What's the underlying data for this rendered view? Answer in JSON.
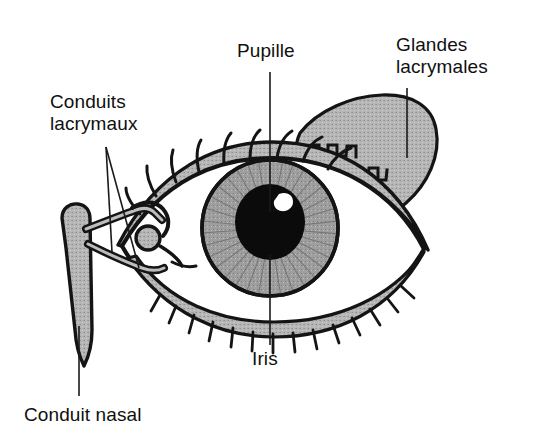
{
  "figure": {
    "language": "fr",
    "background_color": "#ffffff",
    "ink_color": "#101010",
    "tissue_fill_color": "#b4b4b4",
    "iris_fill_color": "#9a9a9a",
    "pupil_fill_color": "#0a0a0a",
    "highlight_color": "#ffffff",
    "sclera_fill_color": "#ffffff"
  },
  "labels": {
    "pupille": "Pupille",
    "glandes_line1": "Glandes",
    "glandes_line2": "lacrymales",
    "conduits_line1": "Conduits",
    "conduits_line2": "lacrymaux",
    "iris": "Iris",
    "conduit_nasal": "Conduit nasal"
  },
  "parts": [
    {
      "id": "pupille",
      "label": "Pupille",
      "description": "Pupille noire centrale avec reflet blanc",
      "color": "#0a0a0a",
      "leader": {
        "x1": 270,
        "y1": 72,
        "x2": 270,
        "y2": 212
      }
    },
    {
      "id": "glandes-lacrymales",
      "label": "Glandes lacrymales",
      "description": "Glande lacrymale lobée grise au-dessus de la paupière supérieure externe",
      "color": "#b4b4b4",
      "leader": {
        "x1": 407,
        "y1": 88,
        "x2": 407,
        "y2": 158
      }
    },
    {
      "id": "conduits-lacrymaux",
      "label": "Conduits lacrymaux",
      "description": "Canalicules lacrymaux au coin interne de l'œil",
      "color": "#b4b4b4",
      "leaders": [
        {
          "x1": 106,
          "y1": 147,
          "x2": 112,
          "y2": 252
        },
        {
          "x1": 106,
          "y1": 147,
          "x2": 139,
          "y2": 268
        }
      ]
    },
    {
      "id": "iris",
      "label": "Iris",
      "description": "Iris gris strié radialement entourant la pupille",
      "color": "#9a9a9a",
      "leader": {
        "x1": 270,
        "y1": 255,
        "x2": 270,
        "y2": 345
      }
    },
    {
      "id": "conduit-nasal",
      "label": "Conduit nasal",
      "description": "Conduit lacrymo-nasal descendant vers la cavité nasale",
      "color": "#b4b4b4",
      "leader": {
        "x1": 79,
        "y1": 326,
        "x2": 79,
        "y2": 396
      }
    }
  ]
}
